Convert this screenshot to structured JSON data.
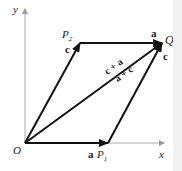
{
  "diagram": {
    "type": "vector-parallelogram",
    "axes": {
      "x_label": "x",
      "y_label": "y",
      "color": "#aaaaaa"
    },
    "points": {
      "origin": "O",
      "p1": "P",
      "p1_sub": "1",
      "p2": "P",
      "p2_sub": "2",
      "q": "Q"
    },
    "vectors": {
      "a_bottom": "a",
      "c_left": "c",
      "a_top": "a",
      "c_right": "c",
      "sum_upper": "c + a",
      "sum_lower": "a + c"
    },
    "colors": {
      "vector": "#111111",
      "axis": "#aaaaaa",
      "text": "#222222"
    }
  }
}
